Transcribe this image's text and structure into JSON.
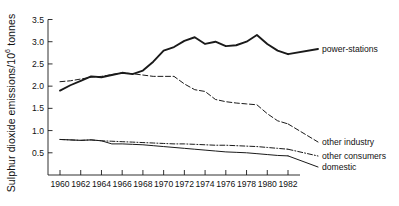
{
  "chart_data": {
    "type": "line",
    "title": "",
    "xlabel": "",
    "ylabel": "Sulphur dioxide emissions/10^6 tonnes",
    "ylabel_prefix": "Sulphur dioxide emissions/10",
    "ylabel_exponent": "6",
    "ylabel_suffix": " tonnes",
    "xlim": [
      1959,
      1983
    ],
    "ylim": [
      0,
      3.5
    ],
    "grid": false,
    "legend_position": "right-inline",
    "yticks": [
      0.5,
      1.0,
      1.5,
      2.0,
      2.5,
      3.0,
      3.5
    ],
    "ytick_labels": [
      "0.5",
      "1.0",
      "1.5",
      "2.0",
      "2.5",
      "3.0",
      "3.5"
    ],
    "xticks": [
      1960,
      1962,
      1964,
      1966,
      1968,
      1970,
      1972,
      1974,
      1976,
      1978,
      1980,
      1982
    ],
    "xtick_labels": [
      "1960",
      "1962",
      "1964",
      "1966",
      "1968",
      "1970",
      "1972",
      "1974",
      "1976",
      "1978",
      "1980",
      "1982"
    ],
    "x": [
      1960,
      1961,
      1962,
      1963,
      1964,
      1965,
      1966,
      1967,
      1968,
      1969,
      1970,
      1971,
      1972,
      1973,
      1974,
      1975,
      1976,
      1977,
      1978,
      1979,
      1980,
      1981,
      1982
    ],
    "series": [
      {
        "name": "power-stations",
        "style": "solid-thick",
        "color": "#1a1a1a",
        "values": [
          1.9,
          2.02,
          2.12,
          2.22,
          2.2,
          2.25,
          2.3,
          2.27,
          2.35,
          2.55,
          2.8,
          2.88,
          3.02,
          3.1,
          2.95,
          3.0,
          2.9,
          2.92,
          3.0,
          3.15,
          2.95,
          2.8,
          2.72
        ]
      },
      {
        "name": "other industry",
        "style": "dashed",
        "color": "#1a1a1a",
        "values": [
          2.1,
          2.12,
          2.16,
          2.2,
          2.22,
          2.26,
          2.3,
          2.28,
          2.25,
          2.22,
          2.22,
          2.22,
          2.05,
          1.92,
          1.88,
          1.7,
          1.65,
          1.62,
          1.6,
          1.58,
          1.38,
          1.22,
          1.15
        ]
      },
      {
        "name": "other consumers",
        "style": "dash-dot",
        "color": "#1a1a1a",
        "values": [
          0.8,
          0.79,
          0.78,
          0.79,
          0.77,
          0.76,
          0.75,
          0.74,
          0.73,
          0.72,
          0.71,
          0.7,
          0.7,
          0.69,
          0.68,
          0.67,
          0.67,
          0.66,
          0.65,
          0.64,
          0.62,
          0.6,
          0.58
        ]
      },
      {
        "name": "domestic",
        "style": "solid-thin",
        "color": "#1a1a1a",
        "values": [
          0.8,
          0.79,
          0.78,
          0.79,
          0.77,
          0.7,
          0.7,
          0.69,
          0.68,
          0.66,
          0.64,
          0.62,
          0.6,
          0.58,
          0.56,
          0.54,
          0.52,
          0.51,
          0.5,
          0.48,
          0.46,
          0.44,
          0.43
        ]
      }
    ],
    "annotations": [
      {
        "text": "power-stations",
        "series": "power-stations"
      },
      {
        "text": "other industry",
        "series": "other industry"
      },
      {
        "text": "other consumers",
        "series": "other consumers"
      },
      {
        "text": "domestic",
        "series": "domestic"
      }
    ]
  }
}
